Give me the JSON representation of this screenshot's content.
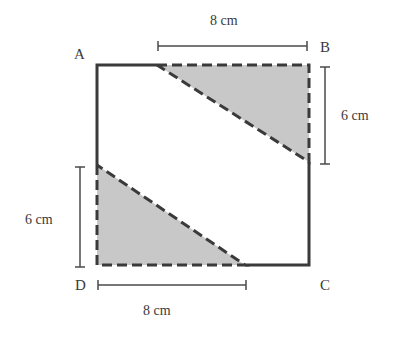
{
  "diagram": {
    "type": "geometry-figure",
    "colors": {
      "outline": "#3a3a3a",
      "shade": "#c8c8c8",
      "text": "#3a3a3a"
    },
    "vertices": {
      "A": "A",
      "B": "B",
      "C": "C",
      "D": "D"
    },
    "dimensions": {
      "top": {
        "label": "8 cm",
        "value": 8,
        "unit": "cm",
        "from_vertex": "B",
        "direction": "left"
      },
      "right": {
        "label": "6 cm",
        "value": 6,
        "unit": "cm",
        "from_vertex": "B",
        "direction": "down"
      },
      "left": {
        "label": "6 cm",
        "value": 6,
        "unit": "cm",
        "from_vertex": "D",
        "direction": "up"
      },
      "bottom": {
        "label": "8 cm",
        "value": 8,
        "unit": "cm",
        "from_vertex": "D",
        "direction": "right"
      }
    },
    "shaded_regions": [
      {
        "name": "upper-right-triangle",
        "corner": "B",
        "legs": [
          "8 cm",
          "6 cm"
        ]
      },
      {
        "name": "lower-left-triangle",
        "corner": "D",
        "legs": [
          "8 cm",
          "6 cm"
        ]
      }
    ]
  }
}
